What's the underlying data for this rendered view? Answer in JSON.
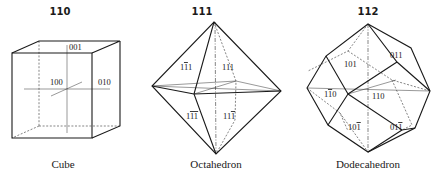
{
  "figures": [
    {
      "number": "110",
      "caption": "Cube",
      "face_labels": [
        "001",
        "100",
        "010"
      ]
    },
    {
      "number": "111",
      "caption": "Octahedron",
      "face_labels": [
        "1̄1̄... "
      ]
    },
    {
      "number": "112",
      "caption": "Dodecahedron",
      "face_labels": [
        "101",
        "011",
        "1̄0",
        "110",
        "10̄1",
        "01̄1"
      ]
    }
  ],
  "cube": {
    "number": "110",
    "caption": "Cube",
    "labels": {
      "top": "001",
      "front": "100",
      "right": "010"
    }
  },
  "octahedron": {
    "number": "111",
    "caption": "Octahedron",
    "labels": {
      "upper_left": "1̄1",
      "upper_right": "111",
      "lower_left": "1̄1̄",
      "lower_right": "111̄"
    }
  },
  "dodecahedron": {
    "number": "112",
    "caption": "Dodecahedron",
    "labels": {
      "upper_left": "101",
      "upper_right": "011",
      "middle_left": "11̄0",
      "middle_right": "110",
      "lower_left": "101̄",
      "lower_right": "011̄"
    }
  }
}
